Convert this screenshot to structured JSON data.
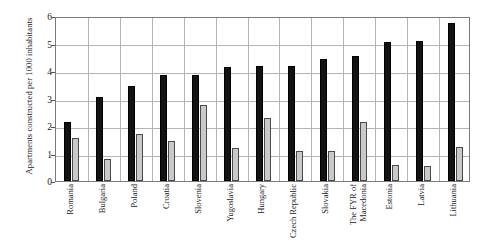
{
  "chart_data": {
    "type": "bar",
    "title": "",
    "xlabel": "",
    "ylabel": "Apartments constructed per 1000 inhabitants",
    "ylim": [
      0,
      6
    ],
    "ytick_labels": [
      "0",
      "1",
      "2",
      "3",
      "4",
      "5",
      "6"
    ],
    "grid": true,
    "legend": "none",
    "categories": [
      "Romania",
      "Bulgaria",
      "Poland",
      "Croatia",
      "Slovenia",
      "Yugoslavia",
      "Hungary",
      "Czech Republic",
      "Slovakia",
      "The FYR of Macedonia",
      "Estonia",
      "Latvia",
      "Lithuania"
    ],
    "series": [
      {
        "name": "dark-series",
        "color": "#121212",
        "values": [
          2.15,
          3.05,
          3.45,
          3.85,
          3.85,
          4.15,
          4.2,
          4.2,
          4.45,
          4.55,
          5.05,
          5.1,
          5.75
        ]
      },
      {
        "name": "light-series",
        "color": "#c9c9c9",
        "values": [
          1.55,
          0.8,
          1.7,
          1.45,
          2.75,
          1.2,
          2.3,
          1.1,
          1.1,
          2.15,
          0.6,
          0.55,
          1.25
        ]
      }
    ]
  }
}
